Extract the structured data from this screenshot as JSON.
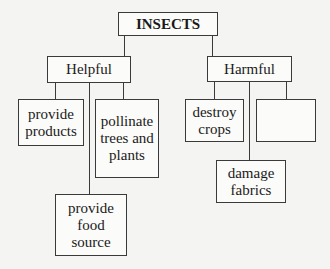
{
  "diagram": {
    "root": {
      "label": "INSECTS"
    },
    "branches": [
      {
        "label": "Helpful",
        "children": [
          {
            "label": "provide\nproducts"
          },
          {
            "label": "provide\nfood\nsource"
          },
          {
            "label": "pollinate\ntrees and\nplants"
          }
        ]
      },
      {
        "label": "Harmful",
        "children": [
          {
            "label": "destroy\ncrops"
          },
          {
            "label": "damage\nfabrics"
          },
          {
            "label": ""
          }
        ]
      }
    ]
  }
}
